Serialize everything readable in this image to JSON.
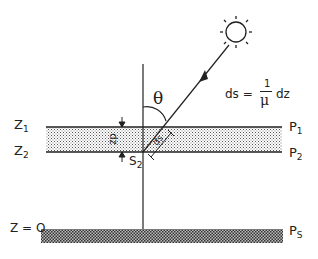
{
  "diagram": {
    "labels": {
      "z1": "Z",
      "z1_sub": "1",
      "z2": "Z",
      "z2_sub": "2",
      "z0": "Z = O",
      "p1": "P",
      "p1_sub": "1",
      "p2": "P",
      "p2_sub": "2",
      "ps": "P",
      "ps_sub": "S",
      "theta": "θ",
      "s2": "S",
      "s2_sub": "2",
      "dz": "dz",
      "ds": "ds",
      "equation_lhs": "ds =",
      "equation_num": "1",
      "equation_den": "μ",
      "equation_rhs": "dz"
    },
    "icons": [
      "sun-icon"
    ],
    "colors": {
      "line": "#222222",
      "fill": "#ffffff"
    }
  }
}
